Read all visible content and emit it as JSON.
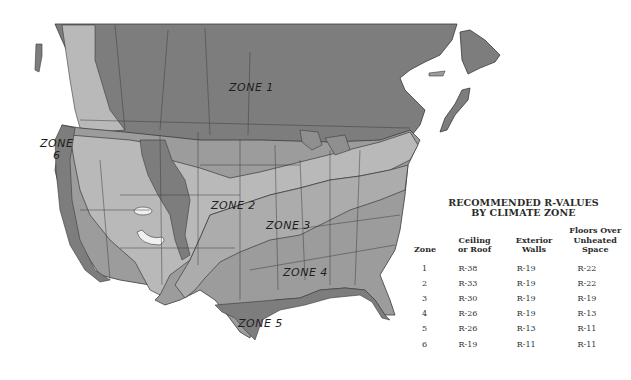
{
  "colors": {
    "zone_dark": "#7d7d7d",
    "zone_medium": "#9c9c9c",
    "zone_light": "#b9b9b9",
    "water": "#ffffff",
    "border": "#3a3a3a"
  },
  "map": {
    "zone_labels": [
      {
        "id": "zone1",
        "text": "ZONE 1"
      },
      {
        "id": "zone2",
        "text": "ZONE 2"
      },
      {
        "id": "zone3",
        "text": "ZONE 3"
      },
      {
        "id": "zone4",
        "text": "ZONE 4"
      },
      {
        "id": "zone5",
        "text": "ZONE 5"
      },
      {
        "id": "zone6",
        "text": "ZONE\n6"
      }
    ]
  },
  "legend": {
    "title_line1": "RECOMMENDED R-VALUES",
    "title_line2": "BY CLIMATE ZONE",
    "columns": [
      "Zone",
      "Ceiling or Roof",
      "Exterior Walls",
      "Floors Over Unheated Space"
    ],
    "column_lines": [
      [
        "Zone"
      ],
      [
        "Ceiling",
        "or Roof"
      ],
      [
        "Exterior",
        "Walls"
      ],
      [
        "Floors Over",
        "Unheated",
        "Space"
      ]
    ],
    "rows": [
      [
        "1",
        "R-38",
        "R-19",
        "R-22"
      ],
      [
        "2",
        "R-33",
        "R-19",
        "R-22"
      ],
      [
        "3",
        "R-30",
        "R-19",
        "R-19"
      ],
      [
        "4",
        "R-26",
        "R-19",
        "R-13"
      ],
      [
        "5",
        "R-26",
        "R-13",
        "R-11"
      ],
      [
        "6",
        "R-19",
        "R-11",
        "R-11"
      ]
    ]
  }
}
